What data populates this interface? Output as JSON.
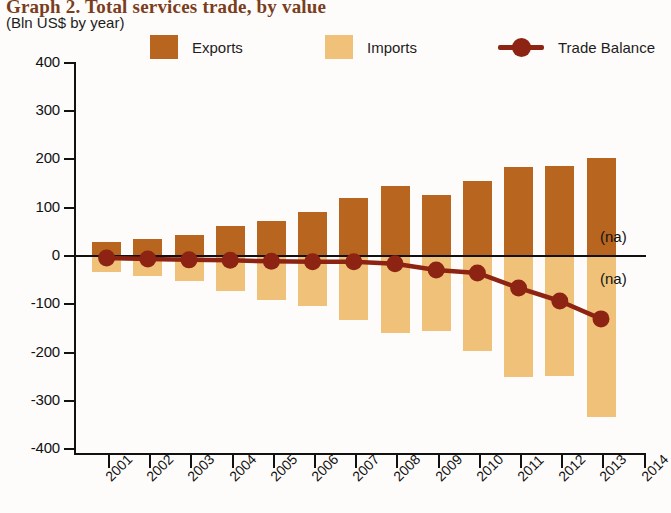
{
  "header": {
    "title": "Graph 2. Total services trade, by value",
    "subtitle": "(Bln US$ by year)"
  },
  "legend": {
    "items": [
      {
        "label": "Exports",
        "type": "swatch",
        "color": "#b7651f",
        "name": "legend-exports"
      },
      {
        "label": "Imports",
        "type": "swatch",
        "color": "#f0c179",
        "name": "legend-imports"
      },
      {
        "label": "Trade Balance",
        "type": "line",
        "color": "#8d2312",
        "name": "legend-trade-balance"
      }
    ]
  },
  "annotations": {
    "na_upper": "(na)",
    "na_lower": "(na)"
  },
  "chart_data": {
    "type": "bar",
    "title": "Graph 2. Total services trade, by value",
    "subtitle": "(Bln US$ by year)",
    "xlabel": "",
    "ylabel": "Bln US$",
    "ylim": [
      -400,
      400
    ],
    "yticks": [
      400,
      300,
      200,
      100,
      0,
      -100,
      -200,
      -300,
      -400
    ],
    "ytick_labels": [
      "400",
      "300",
      "200",
      "100",
      "0",
      "-100",
      "-200",
      "-300",
      "-400"
    ],
    "grid": false,
    "legend_position": "top",
    "categories": [
      "2001",
      "2002",
      "2003",
      "2004",
      "2005",
      "2006",
      "2007",
      "2008",
      "2009",
      "2010",
      "2011",
      "2012",
      "2013"
    ],
    "xtick_labels": [
      "2001",
      "2002",
      "2003",
      "2004",
      "2005",
      "2006",
      "2007",
      "2008",
      "2009",
      "2010",
      "2011",
      "2012",
      "2013",
      "2014"
    ],
    "series": [
      {
        "name": "Exports",
        "type": "bar",
        "color": "#b7651f",
        "values": [
          29,
          35,
          43,
          63,
          72,
          90,
          120,
          145,
          126,
          156,
          185,
          186,
          203
        ]
      },
      {
        "name": "Imports",
        "type": "bar",
        "color": "#f0c179",
        "values": [
          -33,
          -41,
          -51,
          -72,
          -90,
          -104,
          -133,
          -160,
          -155,
          -197,
          -251,
          -248,
          -332
        ]
      },
      {
        "name": "Trade Balance",
        "type": "line",
        "color": "#8d2312",
        "values": [
          -4,
          -6,
          -8,
          -9,
          -11,
          -12,
          -12,
          -16,
          -29,
          -35,
          -66,
          -93,
          -130
        ]
      }
    ]
  }
}
